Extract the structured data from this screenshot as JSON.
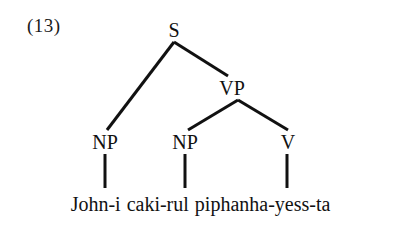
{
  "figure": {
    "example_number": "(13)",
    "ink_color": "#111111",
    "background_color": "#ffffff"
  },
  "tree": {
    "nodes": [
      {
        "id": "S",
        "label": "S",
        "x": 174,
        "y": 30,
        "role": "root-sentence-node"
      },
      {
        "id": "VP",
        "label": "VP",
        "x": 232,
        "y": 88,
        "role": "verb-phrase-node"
      },
      {
        "id": "NP1",
        "label": "NP",
        "x": 105,
        "y": 142,
        "role": "subject-noun-phrase-node"
      },
      {
        "id": "NP2",
        "label": "NP",
        "x": 185,
        "y": 142,
        "role": "object-noun-phrase-node"
      },
      {
        "id": "V",
        "label": "V",
        "x": 288,
        "y": 142,
        "role": "verb-node"
      }
    ],
    "branches": [
      {
        "from": "S",
        "to": "NP1",
        "x1": 174,
        "y1": 42,
        "x2": 107,
        "y2": 130
      },
      {
        "from": "S",
        "to": "VP",
        "x1": 174,
        "y1": 42,
        "x2": 228,
        "y2": 76
      },
      {
        "from": "VP",
        "to": "NP2",
        "x1": 238,
        "y1": 100,
        "x2": 188,
        "y2": 130
      },
      {
        "from": "VP",
        "to": "V",
        "x1": 238,
        "y1": 100,
        "x2": 288,
        "y2": 130
      }
    ],
    "stems": [
      {
        "from": "NP1",
        "x": 105,
        "y1": 154,
        "y2": 188
      },
      {
        "from": "NP2",
        "x": 185,
        "y1": 154,
        "y2": 188
      },
      {
        "from": "V",
        "x": 287,
        "y1": 154,
        "y2": 188
      }
    ],
    "line_width": 3
  },
  "terminals": {
    "words": [
      {
        "text": "John-i",
        "dominated_by": "NP1"
      },
      {
        "text": "caki-rul",
        "dominated_by": "NP2"
      },
      {
        "text": "piphanha-yess-ta",
        "dominated_by": "V"
      }
    ]
  }
}
